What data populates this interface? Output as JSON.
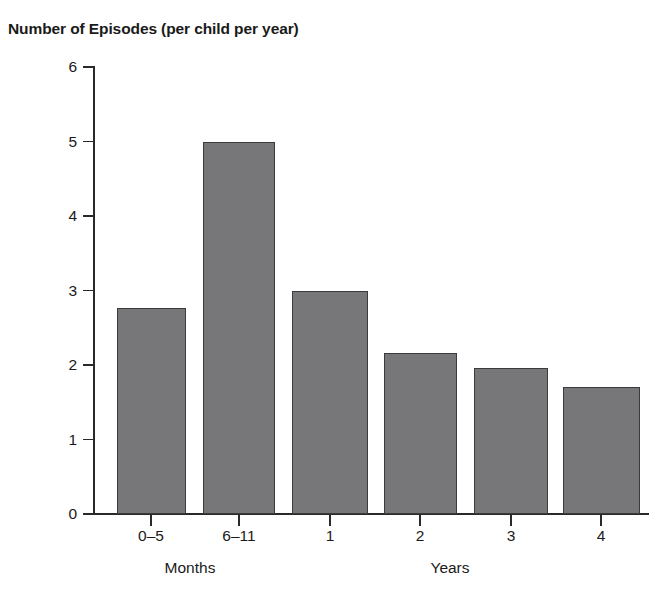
{
  "chart_data": {
    "type": "bar",
    "title": "Number of Episodes (per child per year)",
    "xlabel": "",
    "ylabel": "",
    "categories": [
      "0–5",
      "6–11",
      "1",
      "2",
      "3",
      "4"
    ],
    "values": [
      2.76,
      5.0,
      3.0,
      2.16,
      1.96,
      1.71
    ],
    "ylim": [
      0,
      6
    ],
    "ytick_labels": [
      "0",
      "1",
      "2",
      "3",
      "4",
      "5",
      "6"
    ],
    "ytick_values": [
      0,
      1,
      2,
      3,
      4,
      5,
      6
    ],
    "grid": false,
    "legend": null,
    "bar_color": "#77777a",
    "bar_edge_color": "#3b3b3d",
    "axis_color": "#2a2a2a",
    "group_labels": [
      {
        "text": "Months",
        "center_x": 190
      },
      {
        "text": "Years",
        "center_x": 450
      }
    ]
  },
  "axis": {
    "y_ticks": [
      {
        "label": "6",
        "value": 6
      },
      {
        "label": "5",
        "value": 5
      },
      {
        "label": "4",
        "value": 4
      },
      {
        "label": "3",
        "value": 3
      },
      {
        "label": "2",
        "value": 2
      },
      {
        "label": "1",
        "value": 1
      },
      {
        "label": "0",
        "value": 0
      }
    ],
    "x_ticks": [
      {
        "label": "0–5",
        "center_x": 151
      },
      {
        "label": "6–11",
        "center_x": 239
      },
      {
        "label": "1",
        "center_x": 330
      },
      {
        "label": "2",
        "center_x": 420
      },
      {
        "label": "3",
        "center_x": 511
      },
      {
        "label": "4",
        "center_x": 601
      }
    ]
  },
  "bars": [
    {
      "category": "0–5",
      "value": 2.76,
      "left": 117,
      "width": 69
    },
    {
      "category": "6–11",
      "value": 5.0,
      "left": 203,
      "width": 72
    },
    {
      "category": "1",
      "value": 3.0,
      "left": 292,
      "width": 76
    },
    {
      "category": "2",
      "value": 2.16,
      "left": 384,
      "width": 73
    },
    {
      "category": "3",
      "value": 1.96,
      "left": 474,
      "width": 74
    },
    {
      "category": "4",
      "value": 1.71,
      "left": 563,
      "width": 77
    }
  ]
}
